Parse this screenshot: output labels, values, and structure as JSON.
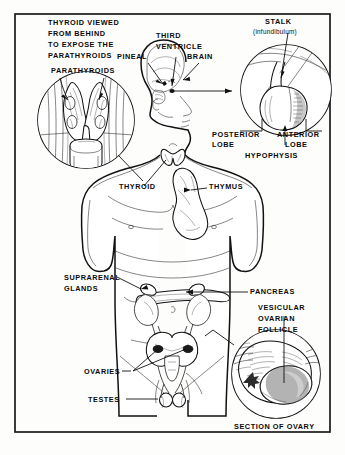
{
  "figure": {
    "title_caption": "SECTION OF OVARY",
    "background_color": "#fdfdfb",
    "ink_color": "#111111",
    "frame": {
      "name": "diagram-border"
    }
  },
  "insets": {
    "thyroid_posterior": {
      "heading_lines": [
        "THYROID VIEWED",
        "FROM BEHIND",
        "TO EXPOSE THE",
        "PARATHYROIDS"
      ],
      "callout": "PARATHYROIDS"
    },
    "hypophysis": {
      "stalk_label": "STALK",
      "stalk_sub": "(infundibulum)",
      "posterior_lobe": "POSTERIOR",
      "posterior_lobe_2": "LOBE",
      "anterior_lobe": "ANTERIOR",
      "anterior_lobe_2": "LOBE",
      "hypophysis": "HYPOPHYSIS"
    },
    "ovary_section": {
      "follicle_1": "VESICULAR",
      "follicle_2": "OVARIAN",
      "follicle_3": "FOLLICLE",
      "caption": "SECTION OF OVARY"
    }
  },
  "head_labels": {
    "pineal": "PINEAL",
    "third": "THIRD",
    "ventricle": "VENTRICLE",
    "brain": "BRAIN"
  },
  "body_labels": {
    "thyroid": "THYROID",
    "thymus": "THYMUS",
    "suprarenal_1": "SUPRARENAL",
    "suprarenal_2": "GLANDS",
    "pancreas": "PANCREAS",
    "ovaries": "OVARIES",
    "testes": "TESTES"
  }
}
